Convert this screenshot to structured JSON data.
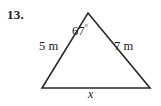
{
  "problem": {
    "number": "13."
  },
  "figure": {
    "type": "triangle",
    "shape_name": "sas-triangle",
    "stroke_color": "#2a2a2a",
    "background_color": "#ffffff",
    "vertices": {
      "apex": {
        "x": 88,
        "y": 13
      },
      "bottom_left": {
        "x": 42,
        "y": 88
      },
      "bottom_right": {
        "x": 150,
        "y": 88
      }
    },
    "labels": {
      "left_side": "5 m",
      "right_side": "7 m",
      "base": "x",
      "angle_value": "67",
      "angle_degree_symbol": "°",
      "angle_full": "67°"
    }
  }
}
